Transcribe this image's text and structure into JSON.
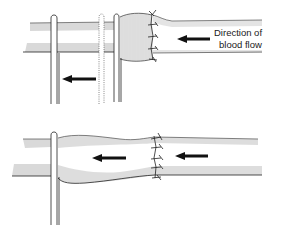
{
  "figure": {
    "top_panel": {
      "description": "Vessel with clamps and sutured anastomosis, distended segment",
      "annotation_line1": "Direction of",
      "annotation_line2": "blood flow",
      "arrows": [
        {
          "name": "flow-arrow-vessel",
          "direction": "left"
        },
        {
          "name": "flow-arrow-below",
          "direction": "left"
        }
      ],
      "posts": 3,
      "suture_stitches": 5
    },
    "bottom_panel": {
      "description": "Vessel after anastomosis with single post, flow continuing left",
      "arrows": [
        {
          "name": "flow-arrow-left",
          "direction": "left"
        },
        {
          "name": "flow-arrow-right",
          "direction": "left"
        }
      ],
      "posts": 1,
      "suture_stitches": 5
    },
    "colors": {
      "ink": "#1a1a1a",
      "hatch": "#555555",
      "background": "#ffffff"
    }
  }
}
